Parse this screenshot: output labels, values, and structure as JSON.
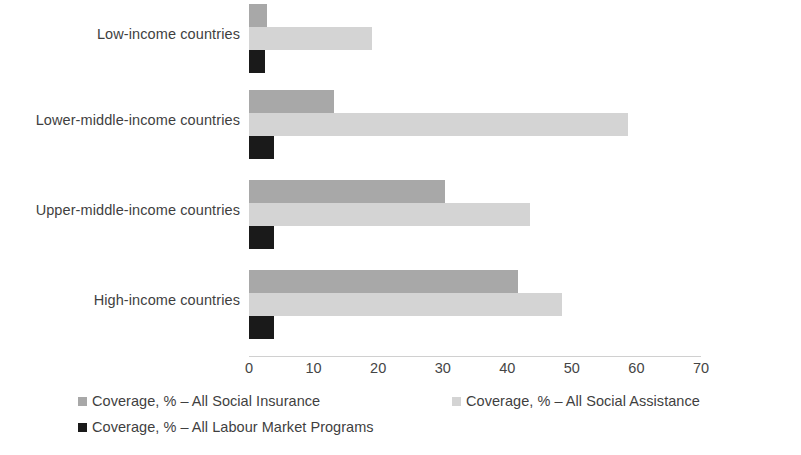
{
  "chart_data": {
    "type": "bar",
    "orientation": "horizontal",
    "title": "",
    "subtitle": "",
    "xlabel": "",
    "ylabel": "",
    "xlim": [
      0,
      70
    ],
    "xticks": [
      0,
      10,
      20,
      30,
      40,
      50,
      60,
      70
    ],
    "grid": false,
    "legend_position": "bottom",
    "categories": [
      "Low-income countries",
      "Lower-middle-income countries",
      "Upper-middle-income countries",
      "High-income countries"
    ],
    "series": [
      {
        "name": "Coverage, % – All Social Insurance",
        "color": "#a8a8a8",
        "values": [
          2.8,
          13.1,
          30.4,
          41.6
        ]
      },
      {
        "name": "Coverage, % – All Social Assistance",
        "color": "#d4d4d4",
        "values": [
          19.1,
          58.7,
          43.5,
          48.4
        ]
      },
      {
        "name": "Coverage, % – All Labour Market Programs",
        "color": "#1a1a1a",
        "values": [
          2.5,
          3.9,
          3.9,
          3.9
        ]
      }
    ]
  },
  "axis": {
    "tick_labels": [
      "0",
      "10",
      "20",
      "30",
      "40",
      "50",
      "60",
      "70"
    ]
  },
  "legend": {
    "items": [
      {
        "label": "Coverage, % – All Social Insurance",
        "color": "#a8a8a8"
      },
      {
        "label": "Coverage, % – All Social Assistance",
        "color": "#d4d4d4"
      },
      {
        "label": "Coverage, % – All Labour Market Programs",
        "color": "#1a1a1a"
      }
    ]
  }
}
